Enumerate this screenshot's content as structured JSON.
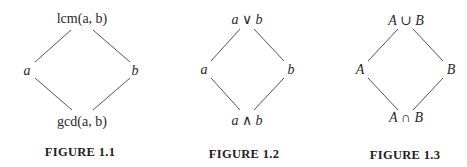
{
  "figures": [
    {
      "caption": "FIGURE 1.1",
      "top": "lcm(a, b)",
      "left": "a",
      "right": "b",
      "bottom": "gcd(a, b)"
    },
    {
      "caption": "FIGURE 1.2",
      "top": "a ∨ b",
      "left": "a",
      "right": "b",
      "bottom": "a ∧ b"
    },
    {
      "caption": "FIGURE 1.3",
      "top": "A ∪ B",
      "left": "A",
      "right": "B",
      "bottom": "A ∩ B"
    }
  ]
}
